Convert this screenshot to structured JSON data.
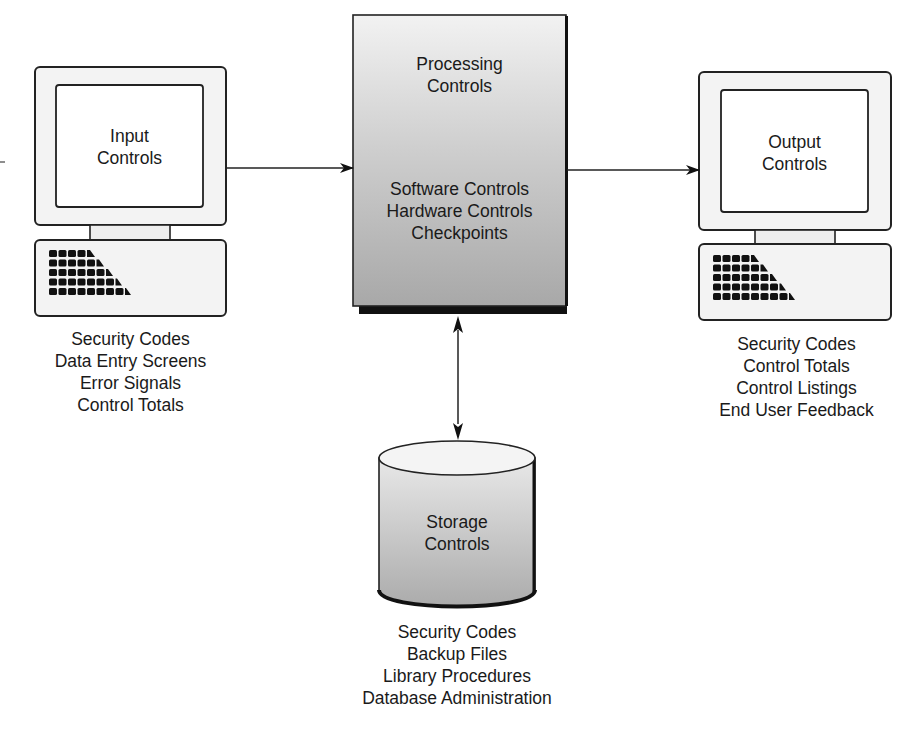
{
  "diagram": {
    "input": {
      "title_lines": [
        "Input",
        "Controls"
      ],
      "items": [
        "Security Codes",
        "Data Entry Screens",
        "Error Signals",
        "Control Totals"
      ]
    },
    "processing": {
      "title_lines": [
        "Processing",
        "Controls"
      ],
      "items": [
        "Software Controls",
        "Hardware Controls",
        "Checkpoints"
      ]
    },
    "output": {
      "title_lines": [
        "Output",
        "Controls"
      ],
      "items": [
        "Security Codes",
        "Control Totals",
        "Control Listings",
        "End User Feedback"
      ]
    },
    "storage": {
      "title_lines": [
        "Storage",
        "Controls"
      ],
      "items": [
        "Security Codes",
        "Backup Files",
        "Library Procedures",
        "Database Administration"
      ]
    },
    "connections": [
      {
        "from": "input",
        "to": "processing",
        "type": "arrow"
      },
      {
        "from": "processing",
        "to": "output",
        "type": "arrow"
      },
      {
        "from": "processing",
        "to": "storage",
        "type": "bidirectional-arrow"
      }
    ],
    "icons": {
      "input": "computer-terminal-icon",
      "processing": "processor-box-icon",
      "output": "computer-terminal-icon",
      "storage": "database-cylinder-icon"
    }
  }
}
